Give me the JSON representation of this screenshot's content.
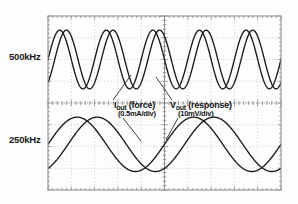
{
  "figure": {
    "kind": "oscilloscope-screen-capture"
  },
  "axis_labels": {
    "upper": "500kHz",
    "lower": "250kHz"
  },
  "annotations": [
    {
      "id": "iout",
      "symbol": "I",
      "subscript": "out",
      "qualifier": " (force)",
      "main": "Iout (force)",
      "scale": "(0.5mA/div)"
    },
    {
      "id": "vout",
      "symbol": "V",
      "subscript": "out",
      "qualifier": " (response)",
      "main": "Vout (response)",
      "scale": "(10mV/div)"
    }
  ],
  "colors": {
    "trace": "#1a1a1a",
    "graticule": "#b9b9bd",
    "graticule_major": "#8c8c92",
    "frame": "#8f8f96",
    "background": "#fdfdfd",
    "text": "#141414"
  },
  "graticule": {
    "x_divisions": 10,
    "y_divisions": 8,
    "style": "dotted",
    "center_axes": true,
    "frame_left": 48,
    "frame_top": 16,
    "frame_right": 281,
    "frame_bottom": 190
  },
  "chart_data": {
    "type": "line",
    "title": "",
    "xlabel": "",
    "ylabel": "",
    "grid": true,
    "legend_position": "inline-annotations",
    "x_units": "divisions",
    "xlim": [
      0,
      10
    ],
    "ylim": [
      0,
      8
    ],
    "panels": [
      {
        "name": "upper-panel",
        "frequency_label": "500kHz",
        "y_center_div": 6.0,
        "series": [
          {
            "name": "Iout (force)",
            "scale": "0.5mA/div",
            "waveform": "sine",
            "cycles_across_screen": 5,
            "amplitude_div": 1.35,
            "phase_deg": 0,
            "offset_div": 0.0
          },
          {
            "name": "Vout (response)",
            "scale": "10mV/div",
            "waveform": "sine",
            "cycles_across_screen": 5,
            "amplitude_div": 1.35,
            "phase_deg": -52,
            "offset_div": 0.0
          }
        ]
      },
      {
        "name": "lower-panel",
        "frequency_label": "250kHz",
        "y_center_div": 2.1,
        "series": [
          {
            "name": "Iout (force)",
            "scale": "0.5mA/div",
            "waveform": "sine",
            "cycles_across_screen": 2,
            "amplitude_div": 1.25,
            "phase_deg": 0,
            "offset_div": 0.0
          },
          {
            "name": "Vout (response)",
            "scale": "10mV/div",
            "waveform": "sine",
            "cycles_across_screen": 2,
            "amplitude_div": 1.25,
            "phase_deg": -62,
            "offset_div": 0.0
          }
        ]
      }
    ]
  }
}
